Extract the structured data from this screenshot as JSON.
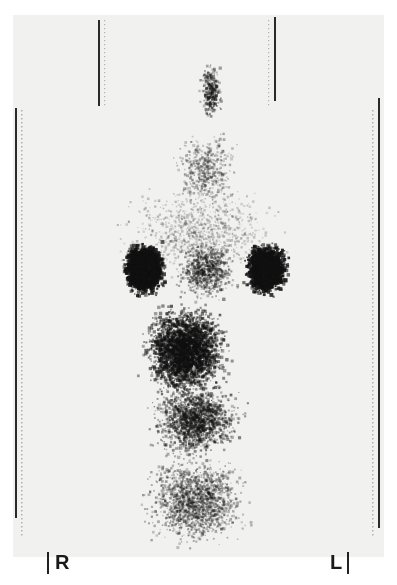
{
  "image": {
    "type": "scintigraphy",
    "description": "Posterior renal/abdominal nuclear scan, grayscale dot image",
    "orientation_labels": {
      "right": "R",
      "left": "L"
    },
    "colors": {
      "background": "#f1f1ef",
      "counts": "#111111",
      "border": "#2a2a2a"
    }
  }
}
